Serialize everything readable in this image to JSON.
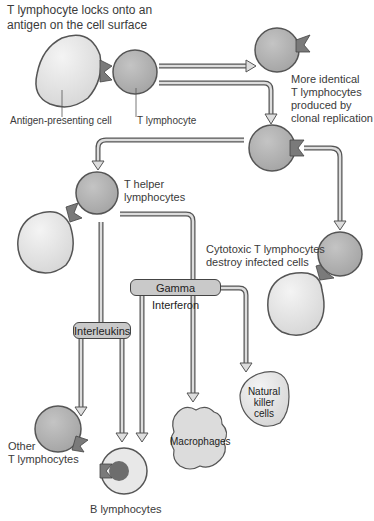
{
  "title": "T lymphocyte locks onto an antigen on the cell surface",
  "title_lines": [
    "T lymphocyte locks onto an",
    "antigen on the cell surface"
  ],
  "labels": {
    "antigen_presenting_cell": "Antigen-presenting cell",
    "t_lymphocyte": "T lymphocyte",
    "clonal": [
      "More identical",
      "T lymphocytes",
      "produced by",
      "clonal replication"
    ],
    "t_helper": [
      "T helper",
      "lymphocytes"
    ],
    "cytotoxic": [
      "Cytotoxic T lymphocytes",
      "destroy infected cells"
    ],
    "other_t": [
      "Other",
      "T lymphocytes"
    ],
    "b_lymphocytes": "B lymphocytes"
  },
  "boxes": {
    "gamma_interferon": "Gamma Interferon",
    "interleukins": "Interleukins"
  },
  "cells": {
    "macrophages": "Macrophages",
    "natural_killer": [
      "Natural",
      "killer",
      "cells"
    ]
  },
  "colors": {
    "t_cell": "#b3b3b3",
    "apc": "#e6e6e6",
    "receptor": "#7a7a7a",
    "arrow": "#d0d0d0",
    "outline": "#555555",
    "b_nucleus": "#6d6d6d"
  }
}
